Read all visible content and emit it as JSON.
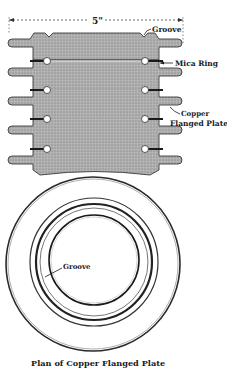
{
  "figure": {
    "dimension_label": "5\"",
    "labels": {
      "groove_top": "Groove",
      "mica_ring": "Mica Ring",
      "copper_line1": "Copper",
      "copper_line2": "Flanged Plate",
      "groove_plan": "Groove"
    },
    "caption": "Plan of Copper Flanged Plate",
    "colors": {
      "plate_fill": "#a9a9a9",
      "plate_stroke": "#3a3a3a",
      "ink": "#1a1a1a",
      "background": "#ffffff"
    },
    "plate_count": 5
  }
}
